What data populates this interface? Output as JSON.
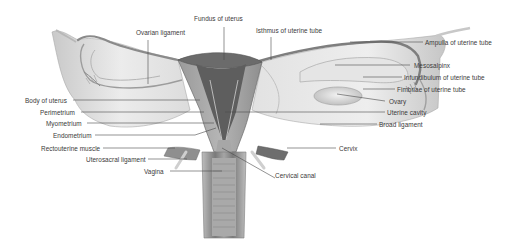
{
  "diagram": {
    "labels": {
      "fundus_of_uterus": "Fundus of uterus",
      "isthmus_of_uterine_tube": "Isthmus of uterine tube",
      "ovarian_ligament": "Ovarian ligament",
      "ampulla_of_uterine_tube": "Ampulla of uterine tube",
      "mesosalpinx": "Mesosalpinx",
      "infundibulum_of_uterine_tube": "Infundibulum of uterine tube",
      "fimbriae_of_uterine_tube": "Fimbriae of uterine tube",
      "ovary": "Ovary",
      "uterine_cavity": "Uterine cavity",
      "broad_ligament": "Broad ligament",
      "cervix": "Cervix",
      "cervical_canal": "Cervical canal",
      "body_of_uterus": "Body of uterus",
      "perimetrium": "Perimetrium",
      "myometrium": "Myometrium",
      "endometrium": "Endometrium",
      "rectouterine_muscle": "Rectouterine muscle",
      "uterosacral_ligament": "Uterosacral ligament",
      "vagina": "Vagina"
    },
    "colors": {
      "label_text": "#3a3a3a",
      "leader_line": "#4a4a4a",
      "tissue_light": "#d9d9d9",
      "tissue_mid": "#a8a8a8",
      "tissue_dark": "#5e5e5e"
    }
  }
}
